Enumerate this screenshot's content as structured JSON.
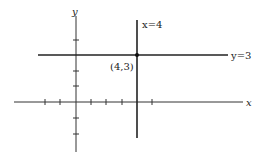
{
  "diagram": {
    "type": "coordinate-plane",
    "axes": {
      "x_label": "x",
      "y_label": "y"
    },
    "lines": [
      {
        "equation": "x=4",
        "label": "x=4",
        "orientation": "vertical"
      },
      {
        "equation": "y=3",
        "label": "y=3",
        "orientation": "horizontal"
      }
    ],
    "intersection": {
      "label": "(4,3)",
      "x": 4,
      "y": 3
    },
    "x_ticks": [
      -2,
      -1,
      1,
      2,
      3,
      4,
      5
    ],
    "y_ticks": [
      -2,
      -1,
      1,
      2,
      3,
      4
    ]
  }
}
